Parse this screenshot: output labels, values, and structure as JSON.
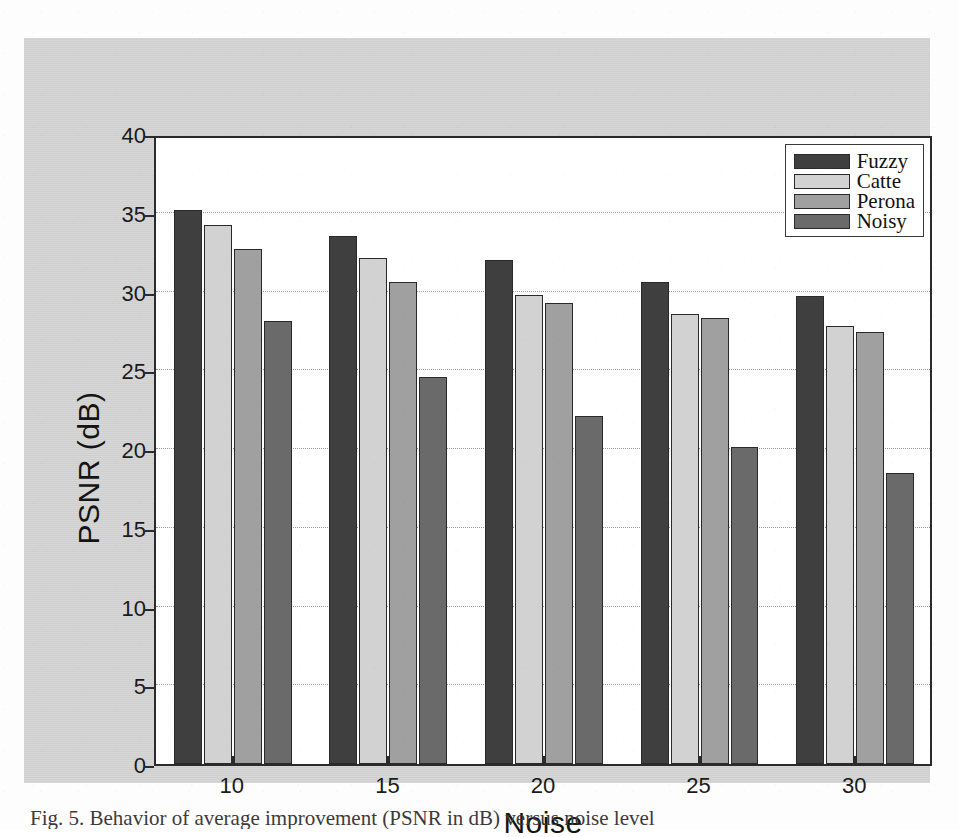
{
  "figure": {
    "caption": "Fig. 5.  Behavior of average improvement (PSNR in dB) versus noise level"
  },
  "chart_data": {
    "type": "bar",
    "title": "",
    "xlabel": "Noise",
    "ylabel": "PSNR (dB)",
    "categories": [
      "10",
      "15",
      "20",
      "25",
      "30"
    ],
    "xlim": [
      7.5,
      32.5
    ],
    "ylim": [
      0,
      40
    ],
    "ytick_values": [
      0,
      5,
      10,
      15,
      20,
      25,
      30,
      35,
      40
    ],
    "ytick_labels": [
      "0",
      "5",
      "10",
      "15",
      "20",
      "25",
      "30",
      "35",
      "40"
    ],
    "xtick_labels": [
      "10",
      "15",
      "20",
      "25",
      "30"
    ],
    "grid": "horizontal-dotted",
    "legend_position": "top-right",
    "series": [
      {
        "name": "Fuzzy",
        "color": "#3f3f3f",
        "values": [
          35.2,
          33.5,
          32.0,
          30.6,
          29.7
        ]
      },
      {
        "name": "Catte",
        "color": "#d2d2d2",
        "values": [
          34.2,
          32.1,
          29.8,
          28.6,
          27.8
        ]
      },
      {
        "name": "Perona",
        "color": "#a0a0a0",
        "values": [
          32.7,
          30.6,
          29.3,
          28.3,
          27.4
        ]
      },
      {
        "name": "Noisy",
        "color": "#6a6a6a",
        "values": [
          28.1,
          24.6,
          22.1,
          20.1,
          18.5
        ]
      }
    ]
  },
  "colors": {
    "page_background": "#fdfdfd",
    "figure_background": "#d3d3d3",
    "axes_background": "#ffffff",
    "axes_line": "#2b2b2b",
    "gridline": "#9a9a9a",
    "text": "#141414"
  }
}
